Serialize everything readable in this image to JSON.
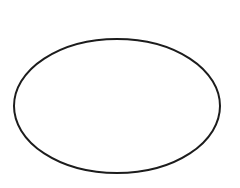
{
  "diagram": {
    "shape": "ellipse",
    "background": "#ffffff",
    "stroke_color": "#1c1c1c",
    "stroke_width": 2,
    "fill": "none",
    "cx": 117,
    "cy": 106,
    "rx": 103,
    "ry": 67
  }
}
